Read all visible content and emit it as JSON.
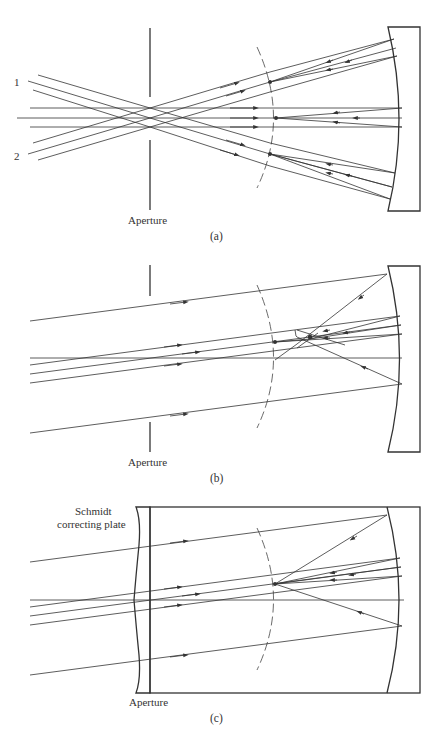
{
  "figure": {
    "panels": [
      {
        "id": "a",
        "caption": "(a)",
        "aperture_label": "Aperture",
        "bundle_labels": [
          "1",
          "2"
        ],
        "description": "Spherical mirror with stop at center of curvature; three parallel bundles focus on a curved (spherical) focal surface"
      },
      {
        "id": "b",
        "caption": "(b)",
        "aperture_label": "Aperture",
        "description": "Spherical mirror with aperture stop; outer rays show spherical aberration focusing closer to mirror"
      },
      {
        "id": "c",
        "caption": "(c)",
        "aperture_label": "Aperture",
        "plate_label_line1": "Schmidt",
        "plate_label_line2": "correcting plate",
        "description": "Schmidt camera: correcting plate at aperture brings all rays to a common focus on the spherical focal surface"
      }
    ],
    "colors": {
      "ink": "#333333",
      "background": "#ffffff"
    }
  }
}
